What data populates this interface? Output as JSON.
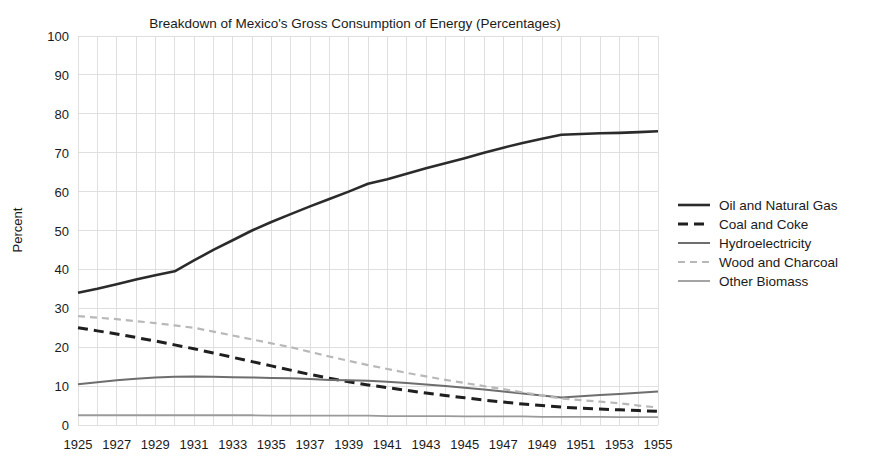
{
  "chart_data": {
    "type": "line",
    "title": "Breakdown of Mexico's Gross Consumption of Energy (Percentages)",
    "xlabel": "",
    "ylabel": "Percent",
    "ylim": [
      0,
      100
    ],
    "xlim": [
      1925,
      1955
    ],
    "ytick_step": 10,
    "yticks": [
      "0",
      "10",
      "20",
      "30",
      "40",
      "50",
      "60",
      "70",
      "80",
      "90",
      "100"
    ],
    "x": [
      1925,
      1926,
      1927,
      1928,
      1929,
      1930,
      1931,
      1932,
      1933,
      1934,
      1935,
      1936,
      1937,
      1938,
      1939,
      1940,
      1941,
      1942,
      1943,
      1944,
      1945,
      1946,
      1947,
      1948,
      1949,
      1950,
      1951,
      1952,
      1953,
      1954,
      1955
    ],
    "xticks": [
      "1925",
      "1927",
      "1929",
      "1931",
      "1933",
      "1935",
      "1937",
      "1939",
      "1941",
      "1943",
      "1945",
      "1947",
      "1949",
      "1951",
      "1953",
      "1955"
    ],
    "grid": true,
    "legend_position": "right",
    "series": [
      {
        "name": "Oil and Natural Gas",
        "color": "#2b2b2b",
        "width": 2.6,
        "dash": "none",
        "values": [
          34,
          35,
          36.2,
          37.4,
          38.5,
          39.5,
          42.3,
          45,
          47.5,
          50,
          52.2,
          54.2,
          56.2,
          58.1,
          60,
          62,
          63.2,
          64.6,
          66,
          67.3,
          68.6,
          70,
          71.3,
          72.5,
          73.6,
          74.6,
          74.8,
          75,
          75.1,
          75.3,
          75.5
        ]
      },
      {
        "name": "Coal and Coke",
        "color": "#1f1f1f",
        "width": 3.0,
        "dash": "10,6",
        "values": [
          25,
          24.2,
          23.4,
          22.5,
          21.6,
          20.6,
          19.6,
          18.5,
          17.4,
          16.3,
          15.2,
          14.1,
          13,
          12,
          11.1,
          10.3,
          9.6,
          8.9,
          8.2,
          7.6,
          7,
          6.4,
          5.9,
          5.4,
          5,
          4.6,
          4.3,
          4.1,
          3.9,
          3.7,
          3.5
        ]
      },
      {
        "name": "Hydroelectricity",
        "color": "#6e6e6e",
        "width": 2.0,
        "dash": "none",
        "values": [
          10.5,
          11,
          11.5,
          11.9,
          12.2,
          12.4,
          12.5,
          12.4,
          12.3,
          12.2,
          12.1,
          12,
          11.8,
          11.6,
          11.5,
          11.4,
          11.1,
          10.8,
          10.4,
          10,
          9.6,
          9.1,
          8.6,
          8.1,
          7.6,
          7.1,
          7.4,
          7.7,
          8,
          8.3,
          8.6
        ]
      },
      {
        "name": "Wood and Charcoal",
        "color": "#b8b8b8",
        "width": 2.2,
        "dash": "7,5",
        "values": [
          28,
          27.6,
          27.2,
          26.7,
          26.2,
          25.6,
          25,
          24,
          23,
          22,
          21,
          20,
          18.8,
          17.6,
          16.5,
          15.4,
          14.4,
          13.4,
          12.5,
          11.6,
          10.8,
          10,
          9.2,
          8.4,
          7.6,
          6.8,
          6.4,
          6,
          5.6,
          5,
          4.5
        ]
      },
      {
        "name": "Other Biomass",
        "color": "#9a9a9a",
        "width": 1.8,
        "dash": "none",
        "values": [
          2.5,
          2.5,
          2.5,
          2.5,
          2.5,
          2.5,
          2.5,
          2.5,
          2.5,
          2.5,
          2.4,
          2.4,
          2.4,
          2.4,
          2.4,
          2.4,
          2.3,
          2.3,
          2.3,
          2.3,
          2.2,
          2.2,
          2.2,
          2.2,
          2.1,
          2.1,
          2.1,
          2.1,
          2,
          2,
          2
        ]
      }
    ]
  },
  "legend": {
    "items": [
      {
        "label": "Oil and Natural Gas"
      },
      {
        "label": "Coal and Coke"
      },
      {
        "label": "Hydroelectricity"
      },
      {
        "label": "Wood and Charcoal"
      },
      {
        "label": "Other Biomass"
      }
    ]
  }
}
